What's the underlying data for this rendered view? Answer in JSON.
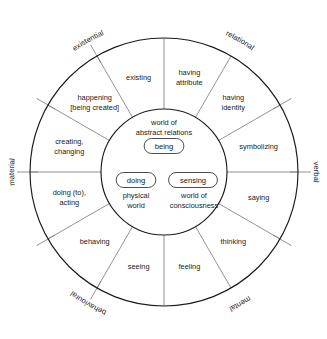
{
  "diagram": {
    "geometry": {
      "center_x": 164,
      "center_y": 172,
      "outer_radius": 134,
      "inner_radius": 63,
      "label_radius": 98,
      "tick_outer_extra": 13
    },
    "colors": {
      "stroke": "#1a1a1a",
      "divider": "#6f6f6f",
      "background": "#ffffff",
      "text": "#1a1a1a"
    },
    "sectors": [
      {
        "id": "having-attribute",
        "lines": [
          "having",
          "attribute"
        ],
        "angle": -75
      },
      {
        "id": "having-identity",
        "lines": [
          "having",
          "identity"
        ],
        "angle": -45
      },
      {
        "id": "symbolizing",
        "lines": [
          "symbolizing"
        ],
        "angle": -15
      },
      {
        "id": "saying",
        "lines": [
          "saying"
        ],
        "angle": 15
      },
      {
        "id": "thinking",
        "lines": [
          "thinking"
        ],
        "angle": 45
      },
      {
        "id": "feeling",
        "lines": [
          "feeling"
        ],
        "angle": 75
      },
      {
        "id": "seeing",
        "lines": [
          "seeing"
        ],
        "angle": 105
      },
      {
        "id": "behaving",
        "lines": [
          "behaving"
        ],
        "angle": 135
      },
      {
        "id": "doing-to-acting",
        "lines": [
          "doing (to),",
          "acting"
        ],
        "angle": 165
      },
      {
        "id": "creating-changing",
        "lines": [
          "creating,",
          "changing"
        ],
        "angle": 195
      },
      {
        "id": "happening-being-created",
        "lines": [
          "happening",
          "[being created]"
        ],
        "angle": 225
      },
      {
        "id": "existing",
        "lines": [
          "existing"
        ],
        "angle": 255
      }
    ],
    "dividers": [
      -90,
      -60,
      -30,
      0,
      30,
      60,
      90,
      120,
      150,
      180,
      210,
      240
    ],
    "ticks": [
      -30,
      0,
      30,
      120,
      150,
      180,
      210,
      240
    ],
    "categories": [
      {
        "id": "relational",
        "label": "relational",
        "angle": -60
      },
      {
        "id": "verbal",
        "label": "verbal",
        "angle": 0
      },
      {
        "id": "mental",
        "label": "mental",
        "angle": 60
      },
      {
        "id": "behavioural",
        "label": "behavioural",
        "angle": 120
      },
      {
        "id": "material",
        "label": "material",
        "angle": 180
      },
      {
        "id": "existential",
        "label": "existential",
        "angle": -120
      }
    ],
    "inner": {
      "abstract_world": [
        "world of",
        "abstract relations"
      ],
      "physical_world": [
        "physical",
        "world"
      ],
      "consciousness_world": [
        "world of",
        "consciousness"
      ],
      "pills": [
        {
          "id": "being",
          "label": "being",
          "cx": 164,
          "cy": 146
        },
        {
          "id": "doing",
          "label": "doing",
          "cx": 136,
          "cy": 180
        },
        {
          "id": "sensing",
          "label": "sensing",
          "cx": 193,
          "cy": 180
        }
      ]
    }
  }
}
